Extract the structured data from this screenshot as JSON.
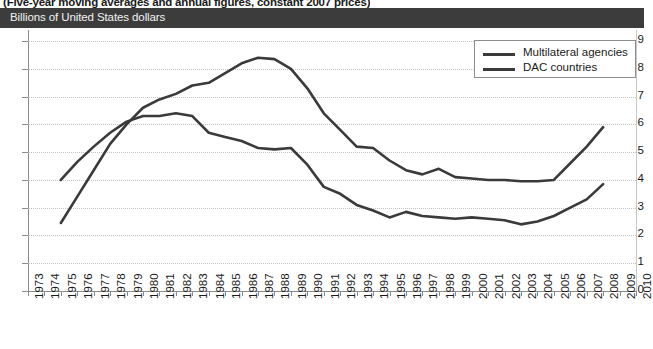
{
  "supertitle": "(Five-year moving averages and annual figures, constant 2007 prices)",
  "header": {
    "unit_label": "Billions of United States dollars"
  },
  "legend": {
    "items": [
      {
        "label": "Multilateral agencies",
        "color": "#3a3a3a"
      },
      {
        "label": "DAC countries",
        "color": "#3a3a3a"
      }
    ]
  },
  "chart_data": {
    "type": "line",
    "title": "(Five-year moving averages and annual figures, constant 2007 prices)",
    "xlabel": "",
    "ylabel": "Billions of United States dollars",
    "ylim": [
      0,
      9.4
    ],
    "xlim": [
      1973,
      2010
    ],
    "yticks": [
      0,
      1,
      2,
      3,
      4,
      5,
      6,
      7,
      8,
      9
    ],
    "grid": true,
    "legend_position": "top-right",
    "categories": [
      1973,
      1974,
      1975,
      1976,
      1977,
      1978,
      1979,
      1980,
      1981,
      1982,
      1983,
      1984,
      1985,
      1986,
      1987,
      1988,
      1989,
      1990,
      1991,
      1992,
      1993,
      1994,
      1995,
      1996,
      1997,
      1998,
      1999,
      2000,
      2001,
      2002,
      2003,
      2004,
      2005,
      2006,
      2007,
      2008,
      2009,
      2010
    ],
    "series": [
      {
        "name": "Multilateral agencies",
        "color": "#3a3a3a",
        "x": [
          1975,
          1976,
          1977,
          1978,
          1979,
          1980,
          1981,
          1982,
          1983,
          1984,
          1985,
          1986,
          1987,
          1988,
          1989,
          1990,
          1991,
          1992,
          1993,
          1994,
          1995,
          1996,
          1997,
          1998,
          1999,
          2000,
          2001,
          2002,
          2003,
          2004,
          2005,
          2006,
          2007,
          2008
        ],
        "values": [
          2.45,
          3.4,
          4.35,
          5.3,
          6.0,
          6.6,
          6.9,
          7.1,
          7.4,
          7.5,
          7.85,
          8.2,
          8.4,
          8.35,
          8.0,
          7.3,
          6.4,
          5.8,
          5.2,
          5.15,
          4.7,
          4.35,
          4.2,
          4.4,
          4.1,
          4.05,
          4.0,
          4.0,
          3.95,
          3.95,
          4.0,
          4.6,
          5.2,
          5.9
        ]
      },
      {
        "name": "DAC countries",
        "color": "#3a3a3a",
        "x": [
          1975,
          1976,
          1977,
          1978,
          1979,
          1980,
          1981,
          1982,
          1983,
          1984,
          1985,
          1986,
          1987,
          1988,
          1989,
          1990,
          1991,
          1992,
          1993,
          1994,
          1995,
          1996,
          1997,
          1998,
          1999,
          2000,
          2001,
          2002,
          2003,
          2004,
          2005,
          2006,
          2007,
          2008
        ],
        "values": [
          4.0,
          4.65,
          5.2,
          5.7,
          6.1,
          6.3,
          6.3,
          6.4,
          6.3,
          5.7,
          5.55,
          5.4,
          5.15,
          5.1,
          5.15,
          4.55,
          3.75,
          3.5,
          3.1,
          2.9,
          2.65,
          2.85,
          2.7,
          2.65,
          2.6,
          2.65,
          2.6,
          2.55,
          2.4,
          2.5,
          2.7,
          3.0,
          3.3,
          3.85
        ]
      }
    ]
  }
}
